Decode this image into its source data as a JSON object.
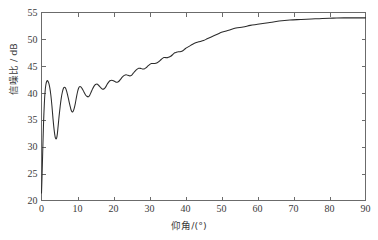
{
  "chart_data": {
    "type": "line",
    "title": "",
    "xlabel": "仰角/(°)",
    "ylabel": "信噪比 / dB",
    "xlim": [
      0,
      90
    ],
    "ylim": [
      20,
      55
    ],
    "xticks": [
      0,
      10,
      20,
      30,
      40,
      50,
      60,
      70,
      80,
      90
    ],
    "yticks": [
      20,
      25,
      30,
      35,
      40,
      45,
      50,
      55
    ],
    "xtick_labels": [
      "0",
      "10",
      "20",
      "30",
      "40",
      "50",
      "60",
      "70",
      "80",
      "90"
    ],
    "ytick_labels": [
      "20",
      "25",
      "30",
      "35",
      "40",
      "45",
      "50",
      "55"
    ],
    "grid": false,
    "legend": false,
    "legend_position": "none",
    "line_color": "#2b2b2b",
    "axis_color": "#6b6b6b",
    "background_color": "#ffffff",
    "annotations": [],
    "series": [
      {
        "name": "信噪比",
        "x": [
          0.0,
          0.15,
          0.3,
          0.45,
          0.6,
          0.8,
          1.0,
          1.2,
          1.45,
          1.7,
          2.0,
          2.3,
          2.6,
          2.9,
          3.2,
          3.5,
          3.8,
          4.0,
          4.2,
          4.4,
          4.6,
          4.9,
          5.2,
          5.5,
          5.8,
          6.1,
          6.4,
          6.7,
          7.0,
          7.3,
          7.6,
          7.9,
          8.2,
          8.5,
          8.8,
          9.1,
          9.4,
          9.7,
          10.0,
          10.3,
          10.6,
          11.0,
          11.4,
          11.8,
          12.2,
          12.6,
          13.0,
          13.4,
          13.8,
          14.2,
          14.6,
          15.0,
          15.4,
          15.8,
          16.2,
          16.6,
          17.0,
          17.4,
          17.8,
          18.2,
          18.6,
          19.0,
          19.5,
          20.0,
          20.5,
          21.0,
          21.5,
          22.0,
          22.5,
          23.0,
          23.5,
          24.0,
          24.5,
          25.0,
          25.5,
          26.0,
          26.5,
          27.0,
          27.5,
          28.0,
          28.5,
          29.0,
          29.5,
          30.0,
          30.5,
          31.0,
          31.5,
          32.0,
          32.5,
          33.0,
          33.5,
          34.0,
          34.5,
          35.0,
          35.5,
          36.0,
          36.5,
          37.0,
          37.5,
          38.0,
          38.5,
          39.0,
          39.5,
          40.0,
          41.0,
          42.0,
          43.0,
          44.0,
          45.0,
          46.0,
          47.0,
          48.0,
          49.0,
          50.0,
          52.0,
          54.0,
          56.0,
          58.0,
          60.0,
          63.0,
          66.0,
          69.0,
          72.0,
          75.0,
          78.0,
          81.0,
          84.0,
          87.0,
          90.0
        ],
        "y": [
          21.4,
          24.5,
          28.2,
          31.8,
          35.0,
          38.2,
          40.3,
          41.5,
          42.2,
          42.3,
          41.9,
          41.0,
          39.6,
          37.6,
          35.2,
          33.2,
          31.8,
          31.5,
          31.6,
          32.4,
          33.7,
          35.8,
          37.6,
          39.1,
          40.2,
          40.9,
          41.1,
          40.9,
          40.3,
          39.5,
          38.6,
          37.7,
          36.9,
          36.5,
          36.6,
          37.2,
          38.1,
          39.2,
          40.2,
          40.9,
          41.2,
          41.1,
          40.7,
          40.2,
          39.7,
          39.4,
          39.3,
          39.6,
          40.2,
          40.8,
          41.3,
          41.6,
          41.7,
          41.5,
          41.2,
          40.9,
          40.7,
          40.8,
          41.1,
          41.6,
          42.0,
          42.3,
          42.4,
          42.3,
          42.1,
          42.0,
          42.2,
          42.6,
          43.0,
          43.3,
          43.4,
          43.3,
          43.2,
          43.3,
          43.7,
          44.1,
          44.4,
          44.6,
          44.6,
          44.5,
          44.5,
          44.7,
          45.0,
          45.3,
          45.5,
          45.5,
          45.5,
          45.6,
          45.8,
          46.1,
          46.4,
          46.6,
          46.6,
          46.6,
          46.7,
          46.9,
          47.2,
          47.5,
          47.6,
          47.7,
          47.7,
          47.8,
          48.0,
          48.3,
          48.7,
          49.1,
          49.4,
          49.6,
          49.8,
          50.1,
          50.4,
          50.7,
          51.0,
          51.3,
          51.7,
          52.1,
          52.3,
          52.6,
          52.8,
          53.1,
          53.4,
          53.6,
          53.7,
          53.8,
          53.9,
          53.95,
          54.0,
          54.0,
          54.0
        ]
      }
    ]
  },
  "axes": {
    "x_axis_label": "仰角/(°)",
    "y_axis_label": "信噪比 / dB"
  }
}
